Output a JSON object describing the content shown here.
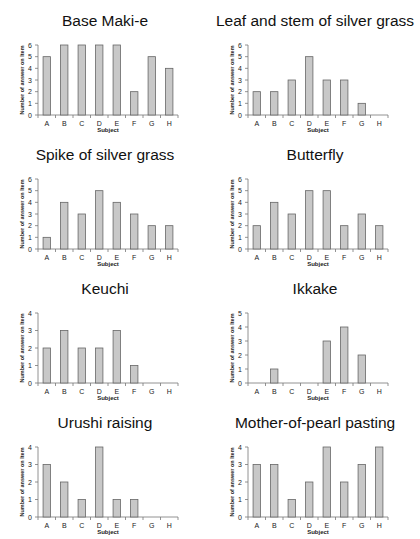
{
  "chart_data": [
    {
      "type": "bar",
      "title": "Base Maki-e",
      "categories": [
        "A",
        "B",
        "C",
        "D",
        "E",
        "F",
        "G",
        "H"
      ],
      "values": [
        5,
        6,
        6,
        6,
        6,
        2,
        5,
        4
      ],
      "xlabel": "Subject",
      "ylabel": "Number of answer on Item",
      "ylim": [
        0,
        6
      ],
      "yticks": [
        0,
        1,
        2,
        3,
        4,
        5,
        6
      ],
      "grid": false,
      "bar_color": "#c8c8c8"
    },
    {
      "type": "bar",
      "title": "Leaf and stem of silver grass",
      "categories": [
        "A",
        "B",
        "C",
        "D",
        "E",
        "F",
        "G",
        "H"
      ],
      "values": [
        2,
        2,
        3,
        5,
        3,
        3,
        1,
        0
      ],
      "xlabel": "Subject",
      "ylabel": "Number of answer on Item",
      "ylim": [
        0,
        6
      ],
      "yticks": [
        0,
        1,
        2,
        3,
        4,
        5,
        6
      ],
      "grid": false,
      "bar_color": "#c8c8c8"
    },
    {
      "type": "bar",
      "title": "Spike of silver grass",
      "categories": [
        "A",
        "B",
        "C",
        "D",
        "E",
        "F",
        "G",
        "H"
      ],
      "values": [
        1,
        4,
        3,
        5,
        4,
        3,
        2,
        2
      ],
      "xlabel": "Subject",
      "ylabel": "Number of answer on Item",
      "ylim": [
        0,
        6
      ],
      "yticks": [
        0,
        1,
        2,
        3,
        4,
        5,
        6
      ],
      "grid": false,
      "bar_color": "#c8c8c8"
    },
    {
      "type": "bar",
      "title": "Butterfly",
      "categories": [
        "A",
        "B",
        "C",
        "D",
        "E",
        "F",
        "G",
        "H"
      ],
      "values": [
        2,
        4,
        3,
        5,
        5,
        2,
        3,
        2
      ],
      "xlabel": "Subject",
      "ylabel": "Number of answer on Item",
      "ylim": [
        0,
        6
      ],
      "yticks": [
        0,
        1,
        2,
        3,
        4,
        5,
        6
      ],
      "grid": false,
      "bar_color": "#c8c8c8"
    },
    {
      "type": "bar",
      "title": "Keuchi",
      "categories": [
        "A",
        "B",
        "C",
        "D",
        "E",
        "F",
        "G",
        "H"
      ],
      "values": [
        2,
        3,
        2,
        2,
        3,
        1,
        0,
        0
      ],
      "xlabel": "Subject",
      "ylabel": "Number of answer on Item",
      "ylim": [
        0,
        4
      ],
      "yticks": [
        0,
        1,
        2,
        3,
        4
      ],
      "grid": false,
      "bar_color": "#c8c8c8"
    },
    {
      "type": "bar",
      "title": "Ikkake",
      "categories": [
        "A",
        "B",
        "C",
        "D",
        "E",
        "F",
        "G",
        "H"
      ],
      "values": [
        0,
        1,
        0,
        0,
        3,
        4,
        2,
        0
      ],
      "xlabel": "Subject",
      "ylabel": "Number of answer on Item",
      "ylim": [
        0,
        5
      ],
      "yticks": [
        0,
        1,
        2,
        3,
        4,
        5
      ],
      "grid": false,
      "bar_color": "#c8c8c8"
    },
    {
      "type": "bar",
      "title": "Urushi raising",
      "categories": [
        "A",
        "B",
        "C",
        "D",
        "E",
        "F",
        "G",
        "H"
      ],
      "values": [
        3,
        2,
        1,
        4,
        1,
        1,
        0,
        0
      ],
      "xlabel": "Subject",
      "ylabel": "Number of answer on Item",
      "ylim": [
        0,
        4
      ],
      "yticks": [
        0,
        1,
        2,
        3,
        4
      ],
      "grid": false,
      "bar_color": "#c8c8c8"
    },
    {
      "type": "bar",
      "title": "Mother-of-pearl pasting",
      "categories": [
        "A",
        "B",
        "C",
        "D",
        "E",
        "F",
        "G",
        "H"
      ],
      "values": [
        3,
        3,
        1,
        2,
        4,
        2,
        3,
        4
      ],
      "xlabel": "Subject",
      "ylabel": "Number of answer on Item",
      "ylim": [
        0,
        4
      ],
      "yticks": [
        0,
        1,
        2,
        3,
        4
      ],
      "grid": false,
      "bar_color": "#c8c8c8"
    }
  ]
}
